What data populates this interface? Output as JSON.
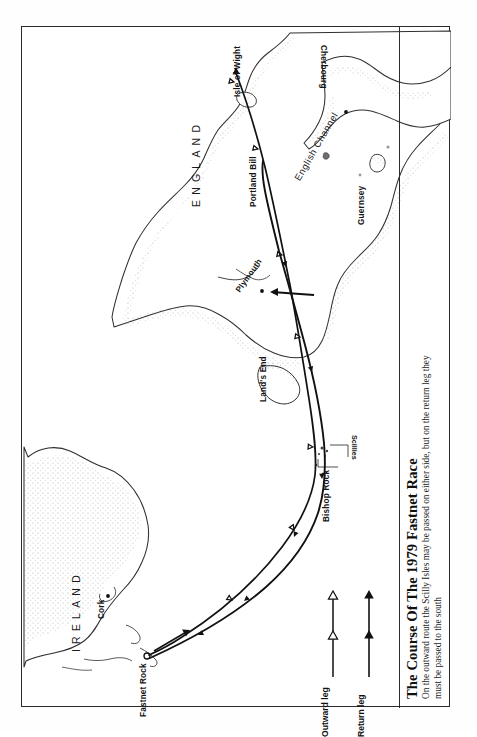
{
  "figure": {
    "title": "The Course Of The 1979 Fastnet Race",
    "caption": "On the outward route the Scilly Isles may be passed on either side, but on the return leg they must be passed to the south"
  },
  "legend": {
    "items": [
      {
        "label": "Outward leg",
        "marker": "hollow-triangle",
        "color": "#111111"
      },
      {
        "label": "Return leg",
        "marker": "filled-triangle",
        "color": "#111111"
      }
    ]
  },
  "map": {
    "countries": [
      {
        "name": "ENGLAND"
      },
      {
        "name": "IRELAND"
      }
    ],
    "seas": [
      {
        "name": "English Channel"
      }
    ],
    "places": [
      {
        "name": "Isle of Wight"
      },
      {
        "name": "Portland Bill"
      },
      {
        "name": "Plymouth"
      },
      {
        "name": "Land's End"
      },
      {
        "name": "Bishop Rock"
      },
      {
        "name": "Scillies"
      },
      {
        "name": "Fastnet Rock"
      },
      {
        "name": "Cork"
      },
      {
        "name": "Cherbourg"
      },
      {
        "name": "Guernsey"
      }
    ],
    "colors": {
      "ink": "#1a1a1a",
      "coast": "#303030",
      "stipple": "#8d8d8d",
      "route": "#111111",
      "frame": "#2b2b2b",
      "paper": "#ffffff"
    }
  }
}
